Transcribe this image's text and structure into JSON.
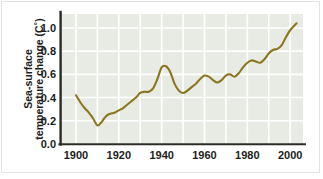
{
  "figure": {
    "background_color": "#ffffff",
    "plot_background_color": "#e8ebe3",
    "gridline_color": "#ffffff",
    "axis_color": "#2b2b26",
    "line_color": "#8a7520"
  },
  "axis": {
    "ylabel_line1": "Sea-surface",
    "ylabel_line2": "temperature change (C˚)",
    "yticks": [
      "0.0",
      "0.2",
      "0.4",
      "0.6",
      "0.8",
      "1.0"
    ],
    "xticks": [
      "1900",
      "1920",
      "1940",
      "1960",
      "1980",
      "2000"
    ]
  },
  "chart_data": {
    "type": "line",
    "title": "",
    "xlabel": "",
    "ylabel": "Sea-surface temperature change (C˚)",
    "xlim": [
      1893,
      2006
    ],
    "ylim": [
      0.0,
      1.12
    ],
    "ytick_values": [
      0.0,
      0.2,
      0.4,
      0.6,
      0.8,
      1.0
    ],
    "xtick_values": [
      1900,
      1920,
      1940,
      1960,
      1980,
      2000
    ],
    "grid": true,
    "legend": "none",
    "series": [
      {
        "name": "Sea-surface temperature change",
        "color": "#8a7520",
        "x": [
          1900,
          1902,
          1904,
          1906,
          1908,
          1910,
          1912,
          1914,
          1916,
          1918,
          1920,
          1922,
          1924,
          1926,
          1928,
          1930,
          1932,
          1934,
          1936,
          1938,
          1940,
          1942,
          1944,
          1946,
          1948,
          1950,
          1952,
          1954,
          1956,
          1958,
          1960,
          1962,
          1964,
          1966,
          1968,
          1970,
          1972,
          1974,
          1976,
          1978,
          1980,
          1982,
          1984,
          1986,
          1988,
          1990,
          1992,
          1994,
          1996,
          1998,
          2000,
          2003
        ],
        "y": [
          0.42,
          0.36,
          0.31,
          0.27,
          0.22,
          0.16,
          0.19,
          0.24,
          0.26,
          0.27,
          0.29,
          0.31,
          0.34,
          0.37,
          0.4,
          0.44,
          0.45,
          0.45,
          0.48,
          0.56,
          0.66,
          0.67,
          0.62,
          0.52,
          0.46,
          0.44,
          0.46,
          0.49,
          0.52,
          0.56,
          0.59,
          0.58,
          0.55,
          0.53,
          0.55,
          0.59,
          0.6,
          0.58,
          0.61,
          0.66,
          0.7,
          0.72,
          0.71,
          0.7,
          0.73,
          0.78,
          0.81,
          0.82,
          0.85,
          0.92,
          0.98,
          1.04
        ]
      }
    ]
  }
}
